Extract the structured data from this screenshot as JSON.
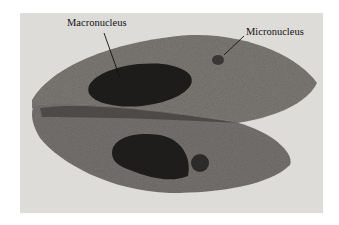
{
  "figure": {
    "labels": [
      {
        "text": "Macronucleus"
      },
      {
        "text": "Micronucleus"
      }
    ]
  }
}
